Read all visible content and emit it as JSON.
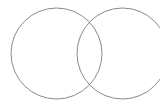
{
  "diagram": {
    "type": "venn",
    "sets": [
      {
        "name": "left-circle",
        "label": ""
      },
      {
        "name": "right-circle",
        "label": ""
      }
    ],
    "colors": {
      "background": "#ffffff",
      "stroke": "#8a8a8a"
    }
  }
}
